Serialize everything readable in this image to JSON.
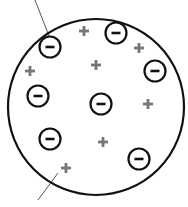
{
  "diagram": {
    "type": "plum-pudding-atom-model",
    "colors": {
      "background": "#ffffff",
      "outline": "#111111",
      "electron": "#111111",
      "proton": "#777777",
      "leader_line": "#555555"
    },
    "atom": {
      "cx": 96,
      "cy": 107,
      "r": 88
    },
    "electrons": [
      {
        "x": 50,
        "y": 47,
        "symbol": "−"
      },
      {
        "x": 116,
        "y": 33,
        "symbol": "−"
      },
      {
        "x": 155,
        "y": 71,
        "symbol": "−"
      },
      {
        "x": 38,
        "y": 96,
        "symbol": "−"
      },
      {
        "x": 101,
        "y": 104,
        "symbol": "−"
      },
      {
        "x": 50,
        "y": 139,
        "symbol": "−"
      },
      {
        "x": 139,
        "y": 159,
        "symbol": "−"
      }
    ],
    "protons": [
      {
        "x": 84,
        "y": 31,
        "symbol": "+"
      },
      {
        "x": 139,
        "y": 48,
        "symbol": "+"
      },
      {
        "x": 30,
        "y": 71,
        "symbol": "+"
      },
      {
        "x": 96,
        "y": 65,
        "symbol": "+"
      },
      {
        "x": 148,
        "y": 104,
        "symbol": "+"
      },
      {
        "x": 103,
        "y": 142,
        "symbol": "+"
      },
      {
        "x": 66,
        "y": 168,
        "symbol": "+"
      }
    ],
    "leader_lines": [
      {
        "x1": 35,
        "y1": 0,
        "x2": 49,
        "y2": 36,
        "points_to": "electron"
      },
      {
        "x1": 38,
        "y1": 200,
        "x2": 58,
        "y2": 173,
        "points_to": "proton"
      }
    ]
  }
}
